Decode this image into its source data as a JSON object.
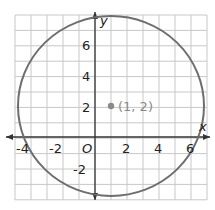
{
  "chart_data": {
    "type": "scatter",
    "title": "",
    "xlabel": "x",
    "ylabel": "y",
    "xlim": [
      -5,
      7
    ],
    "ylim": [
      -4,
      8
    ],
    "grid": true,
    "x_ticks": [
      "-4",
      "-2",
      "2",
      "4",
      "6"
    ],
    "y_ticks": [
      "6",
      "4",
      "2",
      "-2"
    ],
    "origin_label": "O",
    "circle": {
      "center": [
        1,
        2
      ],
      "radius": 5.83
    },
    "points": [
      {
        "x": 1,
        "y": 2,
        "label": "(1, 2)"
      }
    ]
  },
  "colors": {
    "circle": "#6e6e6e",
    "grid": "#c8c8c8",
    "axis": "#333333",
    "point": "#8a8a8a"
  }
}
